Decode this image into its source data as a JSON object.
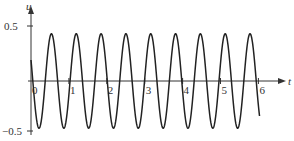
{
  "chart_data": {
    "type": "line",
    "title": "",
    "xlabel": "t",
    "ylabel": "u",
    "xlim": [
      0,
      6.05
    ],
    "ylim": [
      -0.5,
      0.5
    ],
    "x_ticks": [
      "0",
      "1",
      "2",
      "3",
      "4",
      "5",
      "6"
    ],
    "y_ticks": [
      "0.5",
      "−0.5"
    ],
    "grid": false,
    "legend": null,
    "series": [
      {
        "name": "u(t)",
        "formula": "u = 0.45 cos(9.6 t + 1.11)",
        "amplitude": 0.45,
        "period": 0.655,
        "u0": 0.2,
        "t_end": 6.03
      }
    ],
    "colors": {
      "curve": "#222222",
      "axes": "#333333"
    }
  }
}
